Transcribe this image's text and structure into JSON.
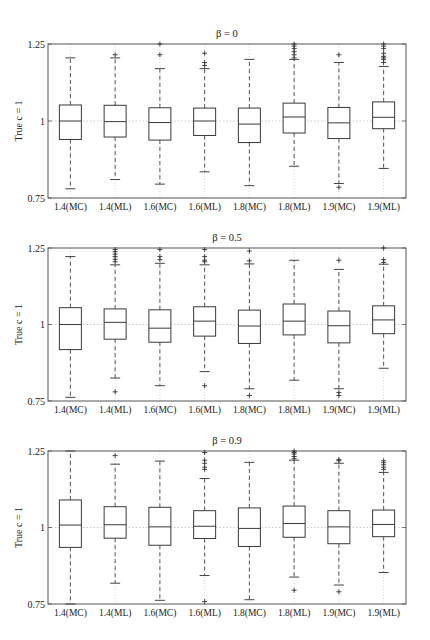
{
  "chart_data": [
    {
      "type": "box",
      "title": "β = 0",
      "ylabel": "True c = 1",
      "xlabel": "",
      "ylim": [
        0.75,
        1.25
      ],
      "yticks": [
        "0.75",
        "1",
        "1.25"
      ],
      "reference_line": 1.0,
      "categories": [
        "1.4(MC)",
        "1.4(ML)",
        "1.6(MC)",
        "1.6(ML)",
        "1.8(MC)",
        "1.8(ML)",
        "1.9(MC)",
        "1.9(ML)"
      ],
      "boxes": [
        {
          "q1": 0.94,
          "median": 1.0,
          "q3": 1.052,
          "whisker_low": 0.78,
          "whisker_high": 1.205,
          "outliers_high": [],
          "outliers_low": []
        },
        {
          "q1": 0.948,
          "median": 0.998,
          "q3": 1.051,
          "whisker_low": 0.81,
          "whisker_high": 1.205,
          "outliers_high": [
            1.215
          ],
          "outliers_low": []
        },
        {
          "q1": 0.938,
          "median": 0.995,
          "q3": 1.043,
          "whisker_low": 0.795,
          "whisker_high": 1.17,
          "outliers_high": [
            1.215,
            1.25
          ],
          "outliers_low": []
        },
        {
          "q1": 0.953,
          "median": 1.0,
          "q3": 1.042,
          "whisker_low": 0.835,
          "whisker_high": 1.17,
          "outliers_high": [
            1.18,
            1.19,
            1.22
          ],
          "outliers_low": []
        },
        {
          "q1": 0.93,
          "median": 0.99,
          "q3": 1.042,
          "whisker_low": 0.79,
          "whisker_high": 1.2,
          "outliers_high": [],
          "outliers_low": []
        },
        {
          "q1": 0.961,
          "median": 1.013,
          "q3": 1.058,
          "whisker_low": 0.853,
          "whisker_high": 1.2,
          "outliers_high": [
            1.205,
            1.215,
            1.225,
            1.235,
            1.243,
            1.25
          ],
          "outliers_low": []
        },
        {
          "q1": 0.943,
          "median": 0.994,
          "q3": 1.044,
          "whisker_low": 0.797,
          "whisker_high": 1.19,
          "outliers_high": [
            1.215
          ],
          "outliers_low": [
            0.785
          ]
        },
        {
          "q1": 0.975,
          "median": 1.012,
          "q3": 1.062,
          "whisker_low": 0.846,
          "whisker_high": 1.177,
          "outliers_high": [
            1.19,
            1.2,
            1.205,
            1.21,
            1.22,
            1.235,
            1.243,
            1.25
          ],
          "outliers_low": []
        }
      ]
    },
    {
      "type": "box",
      "title": "β = 0.5",
      "ylabel": "True c = 1",
      "xlabel": "",
      "ylim": [
        0.75,
        1.25
      ],
      "yticks": [
        "0.75",
        "1",
        "1.25"
      ],
      "reference_line": 1.0,
      "categories": [
        "1.4(MC)",
        "1.4(ML)",
        "1.6(MC)",
        "1.6(ML)",
        "1.8(MC)",
        "1.8(ML)",
        "1.9(MC)",
        "1.9(ML)"
      ],
      "boxes": [
        {
          "q1": 0.918,
          "median": 1.0,
          "q3": 1.055,
          "whisker_low": 0.762,
          "whisker_high": 1.222,
          "outliers_high": [],
          "outliers_low": []
        },
        {
          "q1": 0.952,
          "median": 1.007,
          "q3": 1.051,
          "whisker_low": 0.825,
          "whisker_high": 1.195,
          "outliers_high": [
            1.205,
            1.213,
            1.222,
            1.23,
            1.238,
            1.245
          ],
          "outliers_low": [
            0.78
          ]
        },
        {
          "q1": 0.942,
          "median": 0.988,
          "q3": 1.048,
          "whisker_low": 0.8,
          "whisker_high": 1.2,
          "outliers_high": [
            1.212,
            1.222,
            1.245
          ],
          "outliers_low": []
        },
        {
          "q1": 0.962,
          "median": 1.011,
          "q3": 1.058,
          "whisker_low": 0.846,
          "whisker_high": 1.195,
          "outliers_high": [
            1.205,
            1.21,
            1.222,
            1.245
          ],
          "outliers_low": [
            0.8
          ]
        },
        {
          "q1": 0.938,
          "median": 0.995,
          "q3": 1.047,
          "whisker_low": 0.79,
          "whisker_high": 1.198,
          "outliers_high": [
            1.208,
            1.24
          ],
          "outliers_low": [
            0.768
          ]
        },
        {
          "q1": 0.966,
          "median": 1.011,
          "q3": 1.067,
          "whisker_low": 0.818,
          "whisker_high": 1.21,
          "outliers_high": [],
          "outliers_low": []
        },
        {
          "q1": 0.94,
          "median": 0.996,
          "q3": 1.044,
          "whisker_low": 0.79,
          "whisker_high": 1.18,
          "outliers_high": [
            1.21
          ],
          "outliers_low": [
            0.778,
            0.768
          ]
        },
        {
          "q1": 0.97,
          "median": 1.015,
          "q3": 1.061,
          "whisker_low": 0.857,
          "whisker_high": 1.197,
          "outliers_high": [
            1.203,
            1.212,
            1.25
          ],
          "outliers_low": []
        }
      ]
    },
    {
      "type": "box",
      "title": "β = 0.9",
      "ylabel": "True c = 1",
      "xlabel": "",
      "ylim": [
        0.75,
        1.25
      ],
      "yticks": [
        "0.75",
        "1",
        "1.25"
      ],
      "reference_line": 1.0,
      "categories": [
        "1.4(MC)",
        "1.4(ML)",
        "1.6(MC)",
        "1.6(ML)",
        "1.8(MC)",
        "1.8(ML)",
        "1.9(MC)",
        "1.9(ML)"
      ],
      "boxes": [
        {
          "q1": 0.935,
          "median": 1.008,
          "q3": 1.09,
          "whisker_low": 0.75,
          "whisker_high": 1.25,
          "outliers_high": [],
          "outliers_low": []
        },
        {
          "q1": 0.965,
          "median": 1.009,
          "q3": 1.068,
          "whisker_low": 0.818,
          "whisker_high": 1.207,
          "outliers_high": [
            1.235
          ],
          "outliers_low": []
        },
        {
          "q1": 0.942,
          "median": 1.002,
          "q3": 1.066,
          "whisker_low": 0.762,
          "whisker_high": 1.217,
          "outliers_high": [],
          "outliers_low": []
        },
        {
          "q1": 0.964,
          "median": 1.004,
          "q3": 1.055,
          "whisker_low": 0.843,
          "whisker_high": 1.16,
          "outliers_high": [
            1.19,
            1.197,
            1.21,
            1.22,
            1.245
          ],
          "outliers_low": [
            0.758
          ]
        },
        {
          "q1": 0.938,
          "median": 0.997,
          "q3": 1.064,
          "whisker_low": 0.764,
          "whisker_high": 1.213,
          "outliers_high": [],
          "outliers_low": []
        },
        {
          "q1": 0.968,
          "median": 1.013,
          "q3": 1.07,
          "whisker_low": 0.838,
          "whisker_high": 1.22,
          "outliers_high": [
            1.225,
            1.232,
            1.24,
            1.245,
            1.25
          ],
          "outliers_low": [
            0.795
          ]
        },
        {
          "q1": 0.947,
          "median": 1.002,
          "q3": 1.055,
          "whisker_low": 0.812,
          "whisker_high": 1.21,
          "outliers_high": [
            1.218,
            1.222
          ],
          "outliers_low": [
            0.79
          ]
        },
        {
          "q1": 0.97,
          "median": 1.01,
          "q3": 1.057,
          "whisker_low": 0.853,
          "whisker_high": 1.18,
          "outliers_high": [
            1.19,
            1.197,
            1.205,
            1.212,
            1.218
          ],
          "outliers_low": []
        }
      ]
    }
  ],
  "style": {
    "axis_color": "#555555",
    "box_color": "#3a3a3a",
    "whisker_color": "#444444",
    "grid_color": "#bbbbbb"
  }
}
